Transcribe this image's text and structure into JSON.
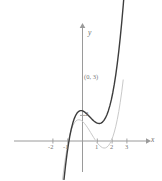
{
  "figure": {
    "background_color": "#ffffff",
    "axis_color": "#9a9a9a",
    "curve_primary_color": "#3d3d3d",
    "curve_secondary_color": "#c9c9c9",
    "label_color": "#777777"
  },
  "axes": {
    "x_axis_name": "x",
    "y_axis_name": "y",
    "x_ticks": [
      {
        "label": "-2",
        "value": -2
      },
      {
        "label": "-1",
        "value": -1
      },
      {
        "label": "1",
        "value": 1
      },
      {
        "label": "2",
        "value": 2
      },
      {
        "label": "3",
        "value": 3
      }
    ],
    "y_ticks": [
      {
        "label": "2",
        "value": 2
      }
    ]
  },
  "annotations": [
    {
      "name": "y-intercept-primary",
      "text": "(0, 3)"
    },
    {
      "name": "y-intercept-secondary",
      "text": "2"
    }
  ],
  "chart_data": {
    "type": "line",
    "title": "",
    "xlabel": "x",
    "ylabel": "y",
    "xlim": [
      -2.6,
      3.6
    ],
    "ylim": [
      -3.0,
      7.5
    ],
    "grid": false,
    "legend": "none",
    "series": [
      {
        "name": "primary-cubic",
        "color": "#3d3d3d",
        "style": "solid",
        "width": 1.4,
        "annotation": "(0, 3)",
        "x": [
          -1.25,
          -1.15,
          -1.05,
          -0.95,
          -0.85,
          -0.75,
          -0.65,
          -0.55,
          -0.45,
          -0.35,
          -0.25,
          -0.15,
          -0.05,
          0.05,
          0.15,
          0.25,
          0.35,
          0.45,
          0.55,
          0.65,
          0.75,
          0.85,
          0.95,
          1.05,
          1.15,
          1.25,
          1.35,
          1.45,
          1.55,
          1.65,
          1.75,
          1.85,
          1.95,
          2.05,
          2.15,
          2.25,
          2.35,
          2.45,
          2.55,
          2.65,
          2.75,
          2.85,
          2.95,
          3.05
        ],
        "y": [
          -3.0,
          -1.95,
          -1.03,
          -0.24,
          0.43,
          0.98,
          1.42,
          1.77,
          2.03,
          2.21,
          2.32,
          2.37,
          2.37,
          2.33,
          2.26,
          2.16,
          2.05,
          1.93,
          1.81,
          1.69,
          1.58,
          1.49,
          1.42,
          1.38,
          1.37,
          1.4,
          1.48,
          1.61,
          1.8,
          2.05,
          2.37,
          2.76,
          3.23,
          3.79,
          4.44,
          5.19,
          6.04,
          7.0,
          8.07,
          9.26,
          10.57,
          12.01,
          13.58,
          15.29
        ]
      },
      {
        "name": "secondary-cubic",
        "color": "#c9c9c9",
        "style": "solid",
        "width": 1.0,
        "annotation": "2",
        "x": [
          -1.35,
          -1.25,
          -1.15,
          -1.05,
          -0.95,
          -0.85,
          -0.75,
          -0.65,
          -0.55,
          -0.45,
          -0.35,
          -0.25,
          -0.15,
          -0.05,
          0.05,
          0.15,
          0.25,
          0.35,
          0.45,
          0.55,
          0.65,
          0.75,
          0.85,
          0.95,
          1.05,
          1.15,
          1.25,
          1.35,
          1.45,
          1.55,
          1.65,
          1.75,
          1.85,
          1.95,
          2.05,
          2.15,
          2.25,
          2.35,
          2.45,
          2.55,
          2.65,
          2.75
        ],
        "y": [
          -3.0,
          -2.1,
          -1.3,
          -0.6,
          0.0,
          0.5,
          0.9,
          1.2,
          1.42,
          1.56,
          1.64,
          1.66,
          1.64,
          1.58,
          1.48,
          1.35,
          1.2,
          1.03,
          0.85,
          0.66,
          0.47,
          0.28,
          0.1,
          -0.07,
          -0.22,
          -0.35,
          -0.45,
          -0.52,
          -0.55,
          -0.54,
          -0.48,
          -0.37,
          -0.2,
          0.03,
          0.33,
          0.7,
          1.15,
          1.68,
          2.3,
          3.02,
          3.84,
          4.77
        ]
      }
    ]
  },
  "geometry": {
    "origin_x": 82.5,
    "origin_y": 141.0,
    "unit_x": 14.8,
    "unit_y": 12.8
  }
}
